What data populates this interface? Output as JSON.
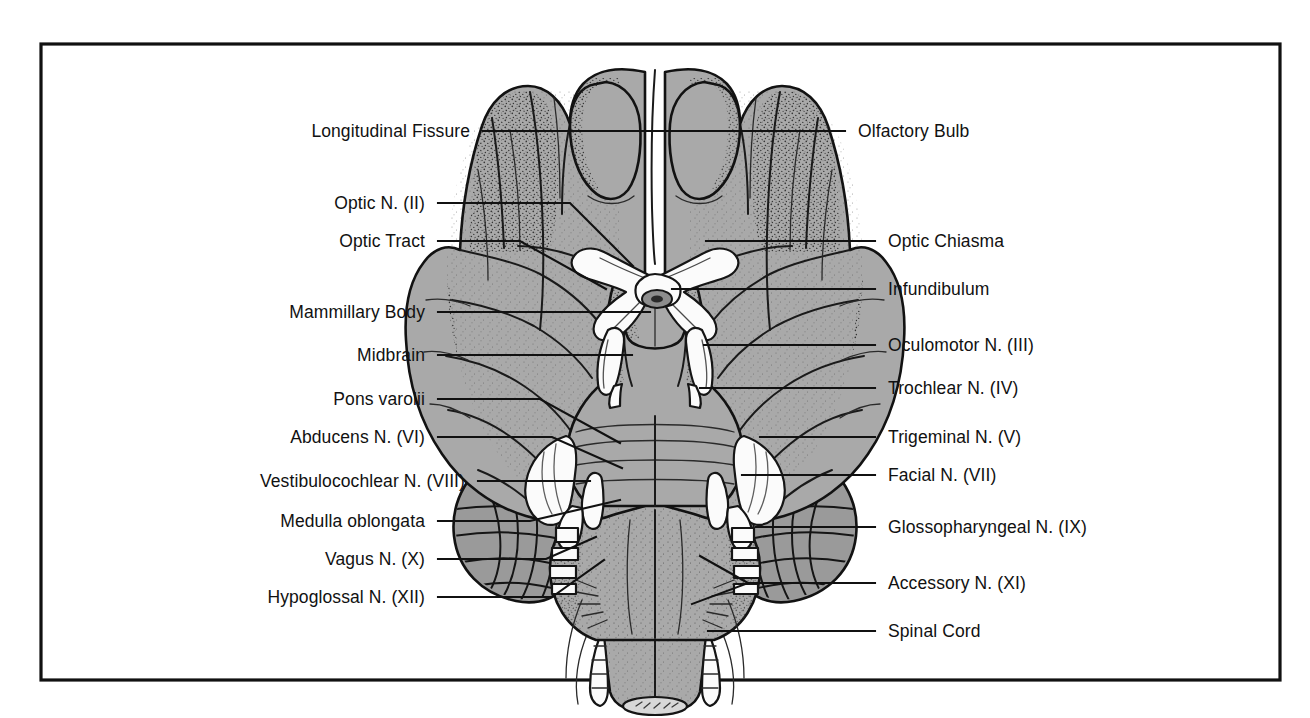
{
  "figure": {
    "frame": {
      "color": "#111111"
    },
    "colors": {
      "ink": "#111111",
      "tissue_gray": "#a9a9a9",
      "tissue_gray_dark": "#9a9a9a",
      "nerve_white": "#fbfbfb",
      "background": "#ffffff"
    }
  },
  "labels_left": [
    {
      "id": "longitudinal-fissure",
      "text": "Longitudinal Fissure"
    },
    {
      "id": "optic-nerve",
      "text": "Optic N. (II)"
    },
    {
      "id": "optic-tract",
      "text": "Optic Tract"
    },
    {
      "id": "mammillary-body",
      "text": "Mammillary Body"
    },
    {
      "id": "midbrain",
      "text": "Midbrain"
    },
    {
      "id": "pons-varolii",
      "text": "Pons varolii"
    },
    {
      "id": "abducens-nerve",
      "text": "Abducens N. (VI)"
    },
    {
      "id": "vestibulocochlear-nerve",
      "text": "Vestibulocochlear N. (VIII)"
    },
    {
      "id": "medulla-oblongata",
      "text": "Medulla oblongata"
    },
    {
      "id": "vagus-nerve",
      "text": "Vagus N. (X)"
    },
    {
      "id": "hypoglossal-nerve",
      "text": "Hypoglossal N. (XII)"
    }
  ],
  "labels_right": [
    {
      "id": "olfactory-bulb",
      "text": "Olfactory Bulb"
    },
    {
      "id": "optic-chiasma",
      "text": "Optic Chiasma"
    },
    {
      "id": "infundibulum",
      "text": "Infundibulum"
    },
    {
      "id": "oculomotor-nerve",
      "text": "Oculomotor N. (III)"
    },
    {
      "id": "trochlear-nerve",
      "text": "Trochlear N. (IV)"
    },
    {
      "id": "trigeminal-nerve",
      "text": "Trigeminal N. (V)"
    },
    {
      "id": "facial-nerve",
      "text": "Facial N. (VII)"
    },
    {
      "id": "glossopharyngeal-nerve",
      "text": "Glossopharyngeal N. (IX)"
    },
    {
      "id": "accessory-nerve",
      "text": "Accessory N. (XI)"
    },
    {
      "id": "spinal-cord",
      "text": "Spinal Cord"
    }
  ]
}
